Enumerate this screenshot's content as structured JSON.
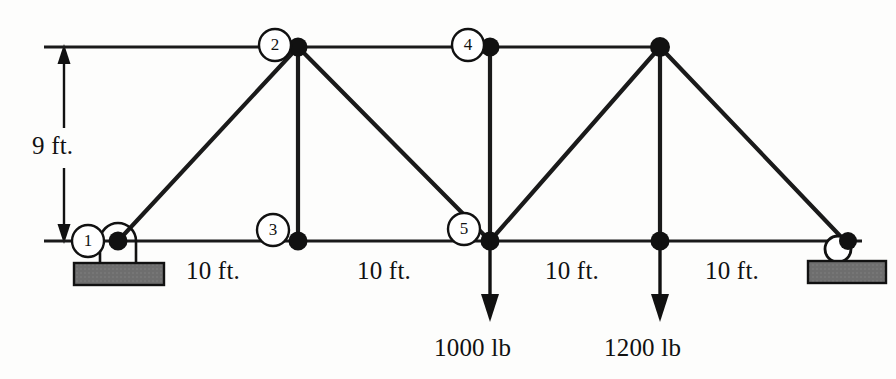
{
  "figure": {
    "type": "statics-truss-free-body-diagram",
    "units": {
      "length": "ft.",
      "force": "lb"
    }
  },
  "dimensions": {
    "height_label": "9 ft.",
    "span_labels": [
      "10 ft.",
      "10 ft.",
      "10 ft.",
      "10 ft."
    ]
  },
  "loads": [
    {
      "label": "1000 lb",
      "magnitude": 1000,
      "unit": "lb",
      "direction": "down",
      "at_node": "5"
    },
    {
      "label": "1200 lb",
      "magnitude": 1200,
      "unit": "lb",
      "direction": "down",
      "at_node": ""
    }
  ],
  "nodes": [
    {
      "id": "1",
      "label": "1",
      "labeled": true,
      "x": 118,
      "y": 241,
      "support": "pin"
    },
    {
      "id": "2",
      "label": "2",
      "labeled": true,
      "x": 298,
      "y": 47,
      "support": ""
    },
    {
      "id": "3",
      "label": "3",
      "labeled": true,
      "x": 298,
      "y": 241,
      "support": ""
    },
    {
      "id": "4",
      "label": "4",
      "labeled": true,
      "x": 490,
      "y": 47,
      "support": ""
    },
    {
      "id": "5",
      "label": "5",
      "labeled": true,
      "x": 490,
      "y": 241,
      "support": ""
    },
    {
      "id": "6",
      "label": "",
      "labeled": false,
      "x": 660,
      "y": 47,
      "support": ""
    },
    {
      "id": "7",
      "label": "",
      "labeled": false,
      "x": 660,
      "y": 241,
      "support": ""
    },
    {
      "id": "8",
      "label": "",
      "labeled": false,
      "x": 845,
      "y": 241,
      "support": "roller"
    }
  ],
  "supports": {
    "left": {
      "kind": "pin",
      "at_node": "1"
    },
    "right": {
      "kind": "roller",
      "at_node": ""
    }
  },
  "colors": {
    "member": "#1a1a1a",
    "node": "#111111",
    "support_block": "#6e6e6e",
    "support_block_border": "#111111",
    "text": "#111111",
    "background": "#fdfdfc"
  }
}
